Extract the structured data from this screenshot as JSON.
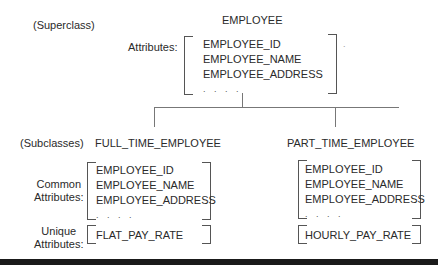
{
  "superclass": {
    "role_label": "(Superclass)",
    "name": "EMPLOYEE",
    "attributes_label": "Attributes:",
    "attributes": [
      "EMPLOYEE_ID",
      "EMPLOYEE_NAME",
      "EMPLOYEE_ADDRESS",
      ". . . ."
    ],
    "stray_mark": "."
  },
  "subclasses_label": "(Subclasses)",
  "common_label": [
    "Common",
    "Attributes:"
  ],
  "unique_label": [
    "Unique",
    "Attributes:"
  ],
  "subclasses": [
    {
      "name": "FULL_TIME_EMPLOYEE",
      "common_attributes": [
        "EMPLOYEE_ID",
        "EMPLOYEE_NAME",
        "EMPLOYEE_ADDRESS",
        ". . . ."
      ],
      "unique_attributes": [
        "FLAT_PAY_RATE"
      ]
    },
    {
      "name": "PART_TIME_EMPLOYEE",
      "common_attributes": [
        "EMPLOYEE_ID",
        "EMPLOYEE_NAME",
        "EMPLOYEE_ADDRESS",
        ". . . ."
      ],
      "unique_attributes": [
        "HOURLY_PAY_RATE"
      ]
    }
  ]
}
